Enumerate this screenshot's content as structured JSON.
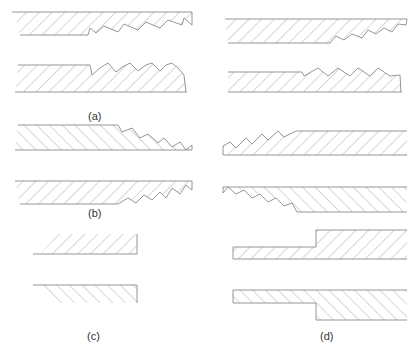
{
  "figure": {
    "panels": [
      {
        "id": "a",
        "label": "(a)",
        "description": "Two threaded joint halves with rightward-leaning sawtooth threads, hatched /"
      },
      {
        "id": "b",
        "label": "(b)",
        "description": "Two threaded joint halves; upper hatched \\, lower hatched /, threads on right"
      },
      {
        "id": "c",
        "label": "(c)",
        "description": "Two plain butt-end plates; upper hatched /, lower hatched \\"
      },
      {
        "id": "d",
        "label": "(d)",
        "description": "Threaded and stepped joint halves; threads and steps at varying positions"
      }
    ]
  },
  "colors": {
    "line": "#8a8a8a",
    "label": "#333333",
    "background": "#ffffff"
  }
}
